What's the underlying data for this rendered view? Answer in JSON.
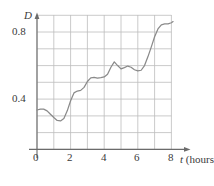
{
  "chart_data": {
    "type": "line",
    "title": "",
    "xlabel": "t (hours)",
    "ylabel": "D",
    "xlim": [
      -0.2,
      9.0
    ],
    "ylim": [
      0.0,
      0.9
    ],
    "grid": true,
    "legend": null,
    "x_ticks": [
      "0",
      "2",
      "4",
      "6",
      "8"
    ],
    "x_tick_values": [
      0,
      2,
      4,
      6,
      8
    ],
    "y_ticks": [
      "0.4",
      "0.8"
    ],
    "y_tick_values": [
      0.4,
      0.8
    ],
    "grid_x_step": 1,
    "grid_y_step": 0.1,
    "series": [
      {
        "name": "D",
        "x": [
          0.0,
          0.2,
          0.4,
          0.6,
          0.8,
          1.0,
          1.2,
          1.4,
          1.6,
          1.8,
          2.0,
          2.2,
          2.4,
          2.6,
          2.8,
          3.0,
          3.2,
          3.4,
          3.6,
          3.8,
          4.0,
          4.2,
          4.4,
          4.6,
          4.8,
          5.0,
          5.2,
          5.4,
          5.6,
          5.8,
          6.0,
          6.2,
          6.4,
          6.6,
          6.8,
          7.0,
          7.2,
          7.4,
          7.6,
          7.8,
          8.0,
          8.1
        ],
        "values": [
          0.335,
          0.34,
          0.34,
          0.33,
          0.31,
          0.29,
          0.273,
          0.27,
          0.285,
          0.33,
          0.39,
          0.437,
          0.448,
          0.452,
          0.47,
          0.505,
          0.527,
          0.53,
          0.525,
          0.528,
          0.532,
          0.548,
          0.59,
          0.622,
          0.6,
          0.58,
          0.588,
          0.597,
          0.59,
          0.575,
          0.568,
          0.572,
          0.6,
          0.652,
          0.71,
          0.772,
          0.818,
          0.843,
          0.848,
          0.848,
          0.855,
          0.862
        ]
      }
    ],
    "line_color": "#8a8a8a",
    "grid_color": "#b9b9b9",
    "axis_color": "#6b6b6b",
    "text_color": "#3a3a3a"
  },
  "labels": {
    "y_axis_title": "D",
    "x_axis_variable": "t",
    "x_axis_unit": "(hours)",
    "y_tick_high": "0.8",
    "y_tick_low": "0.4",
    "x_tick_0": "0",
    "x_tick_2": "2",
    "x_tick_4": "4",
    "x_tick_6": "6",
    "x_tick_8": "8"
  }
}
